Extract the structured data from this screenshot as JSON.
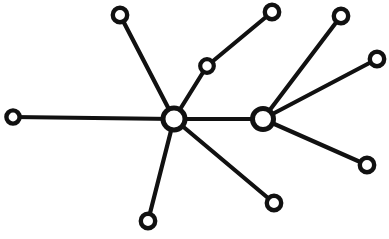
{
  "diagram": {
    "type": "node-link-graph",
    "width": 389,
    "height": 239,
    "background_color": "#ffffff",
    "ink_color": "#111111",
    "node_fill_color": "#ffffff",
    "style": {
      "edge_width": 4.2,
      "hub_stroke_width": 5.0,
      "leaf_stroke_width": 4.4,
      "mid_stroke_width": 4.2
    },
    "nodes": [
      {
        "id": "hub-left",
        "label": "",
        "x": 174,
        "y": 119,
        "r": 11.0,
        "role": "hub",
        "degree": 6
      },
      {
        "id": "hub-right",
        "label": "",
        "x": 263,
        "y": 119,
        "r": 10.5,
        "role": "hub",
        "degree": 4
      },
      {
        "id": "leaf-west",
        "label": "",
        "x": 13,
        "y": 117,
        "r": 6.6,
        "role": "leaf",
        "degree": 1
      },
      {
        "id": "leaf-northwest",
        "label": "",
        "x": 120,
        "y": 15,
        "r": 7.2,
        "role": "leaf",
        "degree": 1
      },
      {
        "id": "node-mid-upper",
        "label": "",
        "x": 207,
        "y": 66,
        "r": 6.8,
        "role": "intermediate",
        "degree": 2
      },
      {
        "id": "leaf-north",
        "label": "",
        "x": 272,
        "y": 12,
        "r": 7.2,
        "role": "leaf",
        "degree": 1
      },
      {
        "id": "leaf-northeast",
        "label": "",
        "x": 341,
        "y": 16,
        "r": 7.2,
        "role": "leaf",
        "degree": 1
      },
      {
        "id": "leaf-east",
        "label": "",
        "x": 377,
        "y": 59,
        "r": 7.2,
        "role": "leaf",
        "degree": 1
      },
      {
        "id": "leaf-southeast",
        "label": "",
        "x": 367,
        "y": 165,
        "r": 7.2,
        "role": "leaf",
        "degree": 1
      },
      {
        "id": "leaf-south-right",
        "label": "",
        "x": 274,
        "y": 203,
        "r": 7.2,
        "role": "leaf",
        "degree": 1
      },
      {
        "id": "leaf-south",
        "label": "",
        "x": 148,
        "y": 221,
        "r": 7.2,
        "role": "leaf",
        "degree": 1
      }
    ],
    "edges": [
      {
        "id": "edge-hubleft-west",
        "from": "hub-left",
        "to": "leaf-west"
      },
      {
        "id": "edge-hubleft-northwest",
        "from": "hub-left",
        "to": "leaf-northwest"
      },
      {
        "id": "edge-hubleft-midupper",
        "from": "hub-left",
        "to": "node-mid-upper"
      },
      {
        "id": "edge-midupper-north",
        "from": "node-mid-upper",
        "to": "leaf-north"
      },
      {
        "id": "edge-hubleft-hubright",
        "from": "hub-left",
        "to": "hub-right"
      },
      {
        "id": "edge-hubleft-southright",
        "from": "hub-left",
        "to": "leaf-south-right"
      },
      {
        "id": "edge-hubleft-south",
        "from": "hub-left",
        "to": "leaf-south"
      },
      {
        "id": "edge-hubright-northeast",
        "from": "hub-right",
        "to": "leaf-northeast"
      },
      {
        "id": "edge-hubright-east",
        "from": "hub-right",
        "to": "leaf-east"
      },
      {
        "id": "edge-hubright-southeast",
        "from": "hub-right",
        "to": "leaf-southeast"
      }
    ],
    "counts": {
      "node_count": 11,
      "edge_count": 10,
      "hub_count": 2
    }
  }
}
